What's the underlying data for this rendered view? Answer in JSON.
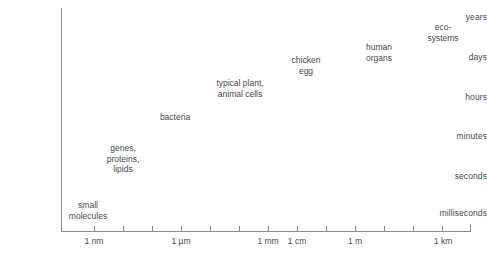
{
  "chart_data": {
    "type": "scatter",
    "title": "",
    "xlabel": "",
    "ylabel": "",
    "grid": false,
    "legend": null,
    "x_axis": {
      "type": "log-length",
      "tick_labels": [
        "1 nm",
        "1 µm",
        "1 mm",
        "1 cm",
        "1 m",
        "1 km"
      ],
      "tick_label_positions_px": [
        94,
        181,
        268,
        297,
        355,
        443
      ],
      "all_tick_positions_px": [
        94,
        123,
        152,
        181,
        210,
        239,
        268,
        297,
        326,
        355,
        384,
        413,
        442,
        470
      ],
      "range_labels": [
        "1 nm",
        "1 km"
      ]
    },
    "y_axis": {
      "type": "log-time",
      "tick_labels": [
        "years",
        "days",
        "hours",
        "minutes",
        "seconds",
        "milliseconds"
      ],
      "tick_label_positions_px": [
        17,
        57,
        97,
        136,
        176,
        213
      ],
      "range_labels": [
        "milliseconds",
        "years"
      ]
    },
    "points": [
      {
        "label": "small\nmolecules",
        "x_px": 88,
        "y_px": 200,
        "size_label": "1 nm",
        "time_label": "milliseconds"
      },
      {
        "label": "genes,\nproteins,\nlipids",
        "x_px": 123,
        "y_px": 143,
        "size_label": "1 nm-1 µm",
        "time_label": "seconds"
      },
      {
        "label": "bacteria",
        "x_px": 175,
        "y_px": 112,
        "size_label": "1 µm",
        "time_label": "minutes"
      },
      {
        "label": "typical plant,\nanimal cells",
        "x_px": 240,
        "y_px": 78,
        "size_label": "10 µm",
        "time_label": "hours"
      },
      {
        "label": "chicken\negg",
        "x_px": 306,
        "y_px": 55,
        "size_label": "1 cm",
        "time_label": "days"
      },
      {
        "label": "human\norgans",
        "x_px": 379,
        "y_px": 42,
        "size_label": "10 cm",
        "time_label": "days-years"
      },
      {
        "label": "eco-\nsystems",
        "x_px": 443,
        "y_px": 22,
        "size_label": "1 km",
        "time_label": "years"
      }
    ]
  },
  "colors": {
    "axis": "#8a8a8a",
    "text": "#4a4a4a",
    "background": "#ffffff"
  }
}
